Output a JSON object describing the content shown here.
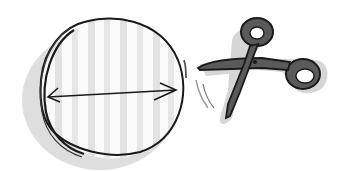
{
  "illustration": {
    "description": "Hand-drawn sketch: a striped circle with a double-headed diameter arrow, next to a pair of scissors with motion lines",
    "colors": {
      "background": "#ffffff",
      "ink": "#1a1a1a",
      "shadow": "#d4d4d4",
      "stripe": "#e2e2e2",
      "scissors_fill": "#5a5a5a"
    },
    "elements": [
      {
        "name": "circle",
        "label": "circle"
      },
      {
        "name": "diameter-arrow",
        "label": "diameter"
      },
      {
        "name": "scissors",
        "label": "scissors"
      }
    ]
  }
}
